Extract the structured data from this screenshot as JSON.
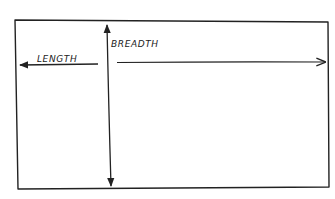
{
  "diagram": {
    "title": "",
    "style": "hand-drawn sketch",
    "stroke_color": "#222222",
    "background_color": "#ffffff",
    "shapes": [
      {
        "id": "rectangle",
        "type": "rectangle",
        "corners": [
          [
            15,
            20
          ],
          [
            328,
            22
          ],
          [
            329,
            187
          ],
          [
            18,
            189
          ]
        ]
      }
    ],
    "arrows": [
      {
        "id": "length-arrow",
        "direction": "left",
        "from": [
          98,
          64
        ],
        "to": [
          20,
          64
        ],
        "label": "LENGTH"
      },
      {
        "id": "breadth-horizontal-arrow",
        "direction": "right",
        "from": [
          117,
          62
        ],
        "to": [
          325,
          62
        ]
      },
      {
        "id": "breadth-vertical-arrow",
        "direction": "both (up and down)",
        "from": [
          107,
          25
        ],
        "to": [
          112,
          186
        ],
        "label": "BREADTH"
      }
    ],
    "labels": {
      "length": "LENGTH",
      "breadth": "BREADTH"
    }
  }
}
